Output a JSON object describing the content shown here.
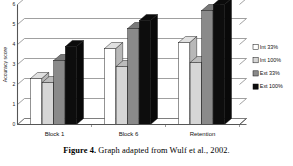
{
  "figure": {
    "caption_label": "Figure 4.",
    "caption_text": "Graph adapted from Wulf et al., 2002."
  },
  "chart_data": {
    "type": "bar",
    "title": "",
    "subtitle": "",
    "xlabel": "",
    "ylabel": "Accuracy score",
    "categories": [
      "Block 1",
      "Block 6",
      "Retention"
    ],
    "series": [
      {
        "name": "Int 33%",
        "color": "#ffffff",
        "values": [
          2.3,
          3.8,
          4.1
        ]
      },
      {
        "name": "Int 100%",
        "color": "#d6d6d6",
        "values": [
          2.1,
          2.9,
          3.1
        ]
      },
      {
        "name": "Ext 33%",
        "color": "#8a8a8a",
        "values": [
          3.2,
          4.8,
          5.7
        ]
      },
      {
        "name": "Ext 100%",
        "color": "#0d0d0d",
        "values": [
          3.9,
          5.2,
          6.0
        ]
      }
    ],
    "ylim": [
      0,
      6
    ],
    "yticks": [
      0,
      1,
      2,
      3,
      4,
      5,
      6
    ],
    "ytick_labels": [
      "0",
      "1",
      "2",
      "3",
      "4",
      "5",
      "6"
    ],
    "grid": true,
    "grid_axis": "y",
    "legend_position": "right",
    "style": "3d-column",
    "axis_color": "#555555",
    "grid_color": "#777777"
  }
}
